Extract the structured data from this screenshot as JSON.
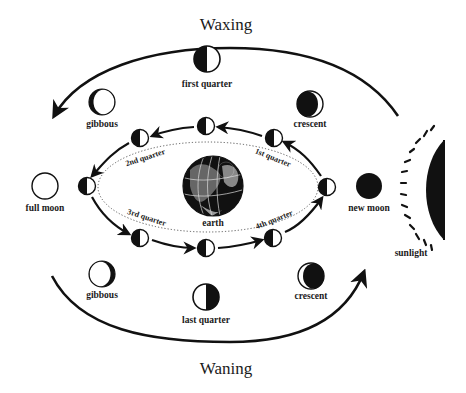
{
  "diagram": {
    "title_top": "Waxing",
    "title_bottom": "Waning",
    "center": {
      "label": "earth",
      "icon": "earth-globe-icon"
    },
    "sun": {
      "label": "sunlight",
      "icon": "sun-half-disc-icon"
    },
    "outer_phases": [
      {
        "id": "new-moon",
        "label": "new moon",
        "shape": "new"
      },
      {
        "id": "crescent-waxing",
        "label": "crescent",
        "shape": "waxing-crescent"
      },
      {
        "id": "first-quarter",
        "label": "first quarter",
        "shape": "first-quarter"
      },
      {
        "id": "gibbous-waxing",
        "label": "gibbous",
        "shape": "waxing-gibbous"
      },
      {
        "id": "full-moon",
        "label": "full moon",
        "shape": "full"
      },
      {
        "id": "gibbous-waning",
        "label": "gibbous",
        "shape": "waning-gibbous"
      },
      {
        "id": "last-quarter",
        "label": "last quarter",
        "shape": "last-quarter"
      },
      {
        "id": "crescent-waning",
        "label": "crescent",
        "shape": "waning-crescent"
      }
    ],
    "orbit_labels": {
      "q1": "1st quarter",
      "q2": "2nd quarter",
      "q3": "3rd quarter",
      "q4": "4th quarter"
    },
    "orbit_positions_count": 8,
    "colors": {
      "ink": "#111111",
      "paper": "#ffffff"
    }
  }
}
